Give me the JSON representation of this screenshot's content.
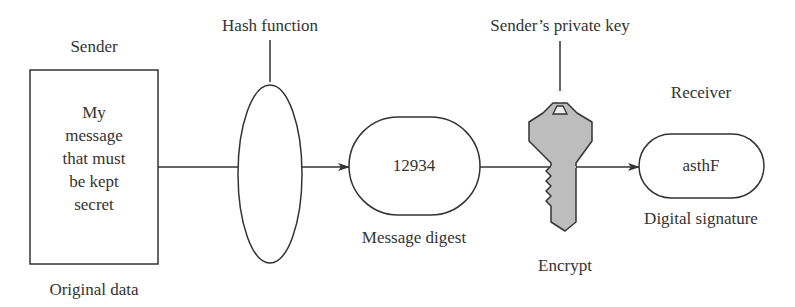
{
  "diagram": {
    "sender": {
      "heading": "Sender",
      "data_lines": [
        "My",
        "message",
        "that must",
        "be kept",
        "secret"
      ],
      "caption": "Original data"
    },
    "hash": {
      "label": "Hash function"
    },
    "digest": {
      "value": "12934",
      "caption": "Message digest"
    },
    "key": {
      "label": "Sender’s private key",
      "caption": "Encrypt",
      "fill_color": "#bdbdbd"
    },
    "receiver": {
      "heading": "Receiver",
      "value": "asthF",
      "caption": "Digital signature"
    },
    "colors": {
      "stroke": "#333333",
      "background": "#ffffff"
    }
  }
}
